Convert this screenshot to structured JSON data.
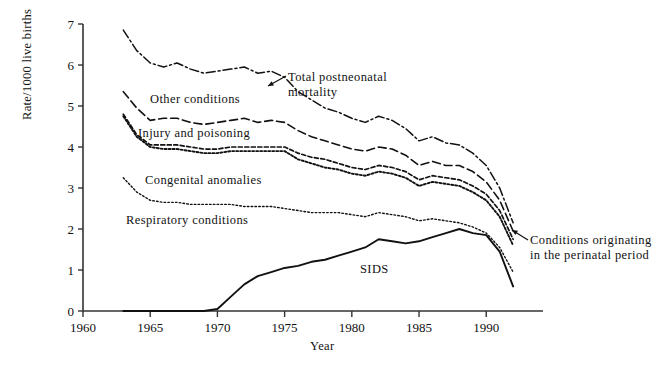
{
  "chart_data": {
    "type": "line",
    "title": "",
    "xlabel": "Year",
    "ylabel": "Rate/1000 live births",
    "xlim": [
      1960,
      1994
    ],
    "ylim": [
      0,
      7
    ],
    "xticks": [
      1960,
      1965,
      1970,
      1975,
      1980,
      1985,
      1990
    ],
    "yticks": [
      0,
      1,
      2,
      3,
      4,
      5,
      6,
      7
    ],
    "grid": false,
    "legend": "inline-annotations",
    "x": [
      1963,
      1964,
      1965,
      1966,
      1967,
      1968,
      1969,
      1970,
      1971,
      1972,
      1973,
      1974,
      1975,
      1976,
      1977,
      1978,
      1979,
      1980,
      1981,
      1982,
      1983,
      1984,
      1985,
      1986,
      1987,
      1988,
      1989,
      1990,
      1991,
      1992
    ],
    "series": [
      {
        "name": "Total postneonatal mortality",
        "style": "dash-dot",
        "values": [
          6.85,
          6.35,
          6.05,
          5.95,
          6.05,
          5.9,
          5.8,
          5.85,
          5.9,
          5.95,
          5.8,
          5.85,
          5.7,
          5.35,
          5.15,
          4.95,
          4.85,
          4.7,
          4.6,
          4.75,
          4.65,
          4.45,
          4.15,
          4.25,
          4.1,
          4.05,
          3.85,
          3.55,
          3.0,
          2.15
        ]
      },
      {
        "name": "Other conditions",
        "style": "dashed",
        "values": [
          5.35,
          4.95,
          4.65,
          4.7,
          4.7,
          4.6,
          4.55,
          4.6,
          4.65,
          4.7,
          4.6,
          4.65,
          4.6,
          4.4,
          4.25,
          4.15,
          4.05,
          3.95,
          3.9,
          4.0,
          3.95,
          3.8,
          3.55,
          3.65,
          3.55,
          3.55,
          3.4,
          3.15,
          2.7,
          1.95
        ]
      },
      {
        "name": "Injury and poisoning",
        "style": "dashed-fine",
        "values": [
          4.8,
          4.3,
          4.05,
          4.05,
          4.05,
          4.0,
          3.95,
          3.95,
          4.0,
          4.0,
          4.0,
          4.0,
          4.0,
          3.85,
          3.75,
          3.7,
          3.6,
          3.5,
          3.45,
          3.55,
          3.5,
          3.4,
          3.2,
          3.3,
          3.25,
          3.2,
          3.05,
          2.85,
          2.45,
          1.75
        ]
      },
      {
        "name": "Congenital anomalies",
        "style": "dotted-bold",
        "values": [
          4.75,
          4.25,
          4.0,
          3.95,
          3.95,
          3.9,
          3.85,
          3.85,
          3.9,
          3.9,
          3.9,
          3.9,
          3.9,
          3.7,
          3.6,
          3.5,
          3.45,
          3.35,
          3.3,
          3.4,
          3.35,
          3.25,
          3.05,
          3.15,
          3.1,
          3.05,
          2.9,
          2.7,
          2.3,
          1.6
        ]
      },
      {
        "name": "Respiratory conditions",
        "style": "dotted-fine",
        "values": [
          3.25,
          2.9,
          2.7,
          2.65,
          2.65,
          2.6,
          2.6,
          2.6,
          2.6,
          2.55,
          2.55,
          2.55,
          2.5,
          2.45,
          2.4,
          2.4,
          2.4,
          2.35,
          2.3,
          2.4,
          2.35,
          2.3,
          2.2,
          2.25,
          2.2,
          2.15,
          2.05,
          1.9,
          1.55,
          0.95
        ]
      },
      {
        "name": "SIDS",
        "style": "solid",
        "values": [
          0.0,
          0.0,
          0.0,
          0.0,
          0.0,
          0.0,
          0.0,
          0.05,
          0.35,
          0.65,
          0.85,
          0.95,
          1.05,
          1.1,
          1.2,
          1.25,
          1.35,
          1.45,
          1.55,
          1.75,
          1.7,
          1.65,
          1.7,
          1.8,
          1.9,
          2.0,
          1.9,
          1.85,
          1.45,
          0.6
        ]
      }
    ],
    "annotations": [
      {
        "name": "total-postneonatal-mortality",
        "text_line1": "Total postneonatal",
        "text_line2": "mortality",
        "arrow": true
      },
      {
        "name": "conditions-originating-perinatal",
        "text_line1": "Conditions originating",
        "text_line2": "in the perinatal period",
        "arrow": true
      }
    ],
    "inline_labels": [
      {
        "name": "other-conditions",
        "text": "Other conditions"
      },
      {
        "name": "injury-and-poisoning",
        "text": "Injury and poisoning"
      },
      {
        "name": "congenital-anomalies",
        "text": "Congenital anomalies"
      },
      {
        "name": "respiratory-conditions",
        "text": "Respiratory conditions"
      },
      {
        "name": "sids",
        "text": "SIDS"
      }
    ],
    "colors": {
      "line": "#111111",
      "axis": "#333333",
      "background": "#ffffff"
    }
  },
  "axis": {
    "y_title": "Rate/1000 live births",
    "x_title": "Year",
    "y_ticks": [
      "0",
      "1",
      "2",
      "3",
      "4",
      "5",
      "6",
      "7"
    ],
    "x_ticks": [
      "1960",
      "1965",
      "1970",
      "1975",
      "1980",
      "1985",
      "1990"
    ]
  },
  "labels": {
    "other_conditions": "Other conditions",
    "injury_and_poisoning": "Injury and poisoning",
    "congenital_anomalies": "Congenital anomalies",
    "respiratory_conditions": "Respiratory conditions",
    "sids": "SIDS",
    "total_postneonatal_1": "Total postneonatal",
    "total_postneonatal_2": "mortality",
    "perinatal_1": "Conditions originating",
    "perinatal_2": "in the perinatal period"
  }
}
